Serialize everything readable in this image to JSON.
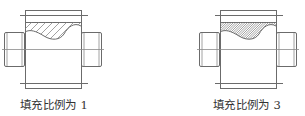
{
  "figures": [
    {
      "id": "left",
      "caption": "填充比例为 1",
      "hatch_scale": 1,
      "hatch_pattern": "coarse-diagonal"
    },
    {
      "id": "right",
      "caption": "填充比例为 3",
      "hatch_scale": 3,
      "hatch_pattern": "fine-diagonal"
    }
  ],
  "colors": {
    "line": "#6b6b6b",
    "hatch": "#7a7a7a",
    "text": "#333333",
    "background": "#ffffff"
  }
}
